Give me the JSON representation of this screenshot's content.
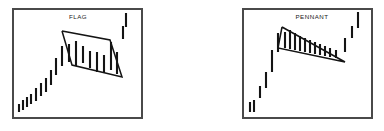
{
  "figure": {
    "background_color": "#ffffff",
    "ink_color": "#141414",
    "frame_color": "#4a4a4a",
    "width": 384,
    "height": 131
  },
  "panels": [
    {
      "id": "flag",
      "title": "FLAG",
      "title_x": 78,
      "title_y": 17,
      "frame": {
        "x": 13,
        "y": 9,
        "width": 129,
        "height": 109
      },
      "pattern_outline": [
        [
          62,
          31
        ],
        [
          110,
          40
        ],
        [
          122,
          77
        ],
        [
          72,
          65
        ],
        [
          62,
          31
        ]
      ],
      "bars": {
        "pole": [
          {
            "x": 19,
            "y1": 112,
            "y2": 104
          },
          {
            "x": 23,
            "y1": 110,
            "y2": 100
          },
          {
            "x": 27,
            "y1": 107,
            "y2": 97
          },
          {
            "x": 31,
            "y1": 104,
            "y2": 94
          },
          {
            "x": 36,
            "y1": 101,
            "y2": 88
          },
          {
            "x": 41,
            "y1": 96,
            "y2": 83
          },
          {
            "x": 46,
            "y1": 92,
            "y2": 78
          },
          {
            "x": 51,
            "y1": 85,
            "y2": 70
          },
          {
            "x": 56,
            "y1": 75,
            "y2": 58
          },
          {
            "x": 62,
            "y1": 66,
            "y2": 46
          }
        ],
        "consolidation": [
          {
            "x": 69,
            "y1": 62,
            "y2": 44
          },
          {
            "x": 76,
            "y1": 66,
            "y2": 41
          },
          {
            "x": 83,
            "y1": 63,
            "y2": 46
          },
          {
            "x": 90,
            "y1": 68,
            "y2": 51
          },
          {
            "x": 97,
            "y1": 72,
            "y2": 52
          },
          {
            "x": 104,
            "y1": 73,
            "y2": 55
          },
          {
            "x": 111,
            "y1": 70,
            "y2": 42
          },
          {
            "x": 117,
            "y1": 74,
            "y2": 52
          }
        ],
        "breakout": [
          {
            "x": 123,
            "y1": 39,
            "y2": 26
          },
          {
            "x": 126,
            "y1": 27,
            "y2": 13
          }
        ]
      }
    },
    {
      "id": "pennant",
      "title": "PENNANT",
      "title_x": 312,
      "title_y": 17,
      "frame": {
        "x": 243,
        "y": 9,
        "width": 129,
        "height": 109
      },
      "pattern_outline": [
        [
          282,
          27
        ],
        [
          345,
          62
        ],
        [
          278,
          48
        ],
        [
          282,
          27
        ]
      ],
      "bars": {
        "pole": [
          {
            "x": 250,
            "y1": 112,
            "y2": 102
          },
          {
            "x": 254,
            "y1": 112,
            "y2": 100
          },
          {
            "x": 260,
            "y1": 98,
            "y2": 86
          },
          {
            "x": 266,
            "y1": 88,
            "y2": 72
          },
          {
            "x": 272,
            "y1": 72,
            "y2": 50
          },
          {
            "x": 278,
            "y1": 52,
            "y2": 33
          }
        ],
        "consolidation": [
          {
            "x": 285,
            "y1": 48,
            "y2": 32
          },
          {
            "x": 290,
            "y1": 49,
            "y2": 30
          },
          {
            "x": 295,
            "y1": 50,
            "y2": 33
          },
          {
            "x": 300,
            "y1": 51,
            "y2": 36
          },
          {
            "x": 305,
            "y1": 52,
            "y2": 38
          },
          {
            "x": 310,
            "y1": 53,
            "y2": 40
          },
          {
            "x": 315,
            "y1": 54,
            "y2": 42
          },
          {
            "x": 320,
            "y1": 55,
            "y2": 44
          },
          {
            "x": 325,
            "y1": 56,
            "y2": 46
          },
          {
            "x": 330,
            "y1": 57,
            "y2": 48
          },
          {
            "x": 336,
            "y1": 58,
            "y2": 50
          }
        ],
        "breakout": [
          {
            "x": 345,
            "y1": 52,
            "y2": 38
          },
          {
            "x": 352,
            "y1": 38,
            "y2": 26
          },
          {
            "x": 358,
            "y1": 28,
            "y2": 12
          }
        ]
      }
    }
  ]
}
